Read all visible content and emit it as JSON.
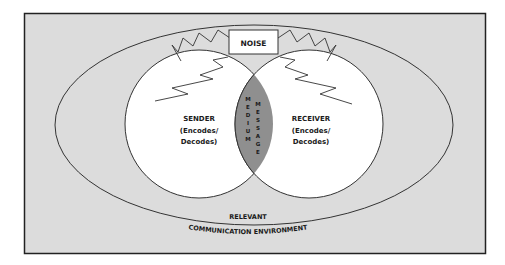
{
  "noise": {
    "label": "NOISE"
  },
  "sender": {
    "title": "SENDER",
    "line1": "(Encodes/",
    "line2": "Decodes)"
  },
  "receiver": {
    "title": "RECEIVER",
    "line1": "(Encodes/",
    "line2": "Decodes)"
  },
  "overlap": {
    "medium": [
      "M",
      "E",
      "D",
      "I",
      "U",
      "M"
    ],
    "message": [
      "M",
      "E",
      "S",
      "S",
      "A",
      "G",
      "E"
    ]
  },
  "environment": {
    "line1": "RELEVANT",
    "line2": "COMMUNICATION ENVIRONMENT"
  },
  "colors": {
    "background": "#dcdcdc",
    "frame": "#222222",
    "circle_fill": "#ffffff",
    "overlap_fill": "#8f8f8f"
  }
}
